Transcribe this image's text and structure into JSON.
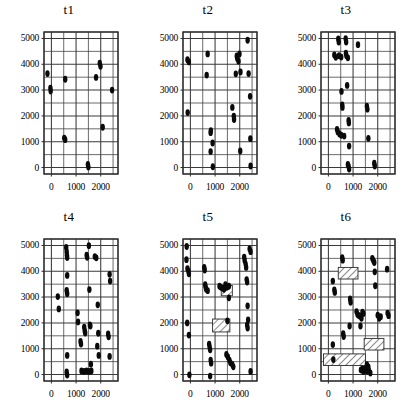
{
  "figure": {
    "kind": "scatter-panel-grid",
    "rows": 2,
    "cols": 3,
    "marker_color": "#0a0a0a",
    "grid_color": "#3a3a3a",
    "frame_color": "#2b2b2b"
  },
  "axes": {
    "y_ticks": [
      0,
      1000,
      2000,
      3000,
      4000,
      5000
    ],
    "y_tick_labels": [
      "0",
      "1000",
      "2000",
      "3000",
      "4000",
      "5000"
    ],
    "x_ticks": [
      0,
      1000,
      2000
    ],
    "x_tick_labels": [
      "0",
      "1000",
      "2000"
    ],
    "xlim": [
      -300,
      2700
    ],
    "ylim": [
      -250,
      5250
    ],
    "x_gridstep": 500,
    "y_gridstep": 500,
    "xlabel": "",
    "ylabel": "",
    "grid": true,
    "legend": "none"
  },
  "chart_data": {
    "type": "scatter",
    "title": "",
    "xlabel": "",
    "ylabel": "",
    "xlim": [
      -300,
      2700
    ],
    "ylim": [
      -250,
      5250
    ],
    "grid": true,
    "panels": [
      {
        "label": "t1",
        "n_points": 11,
        "points": [
          [
            -160,
            3640
          ],
          [
            -40,
            3080
          ],
          [
            -30,
            2960
          ],
          [
            560,
            3420
          ],
          [
            520,
            1140
          ],
          [
            560,
            1080
          ],
          [
            1480,
            120
          ],
          [
            1500,
            20
          ],
          [
            1810,
            3490
          ],
          [
            1960,
            4040
          ],
          [
            1990,
            3920
          ],
          [
            2080,
            1560
          ],
          [
            2460,
            3000
          ]
        ],
        "hatched_rects": []
      },
      {
        "label": "t2",
        "n_points": 24,
        "points": [
          [
            -120,
            4180
          ],
          [
            -60,
            4090
          ],
          [
            -110,
            2130
          ],
          [
            700,
            4400
          ],
          [
            660,
            3580
          ],
          [
            830,
            1430
          ],
          [
            820,
            1350
          ],
          [
            900,
            950
          ],
          [
            820,
            620
          ],
          [
            910,
            30
          ],
          [
            1700,
            2330
          ],
          [
            1760,
            1990
          ],
          [
            1770,
            1860
          ],
          [
            1840,
            3630
          ],
          [
            1880,
            4320
          ],
          [
            1900,
            4220
          ],
          [
            1950,
            4120
          ],
          [
            1990,
            4400
          ],
          [
            2030,
            3700
          ],
          [
            2020,
            640
          ],
          [
            2320,
            4930
          ],
          [
            2360,
            3640
          ],
          [
            2420,
            2760
          ],
          [
            2430,
            1120
          ],
          [
            2440,
            60
          ]
        ],
        "hatched_rects": []
      },
      {
        "label": "t3",
        "n_points": 30,
        "points": [
          [
            240,
            4360
          ],
          [
            300,
            4270
          ],
          [
            400,
            4980
          ],
          [
            420,
            4860
          ],
          [
            430,
            4330
          ],
          [
            520,
            4280
          ],
          [
            530,
            2950
          ],
          [
            560,
            2430
          ],
          [
            570,
            2330
          ],
          [
            350,
            1480
          ],
          [
            380,
            1380
          ],
          [
            450,
            1300
          ],
          [
            520,
            1250
          ],
          [
            640,
            1220
          ],
          [
            700,
            4990
          ],
          [
            720,
            4860
          ],
          [
            710,
            4430
          ],
          [
            730,
            4330
          ],
          [
            790,
            4250
          ],
          [
            760,
            3180
          ],
          [
            820,
            1830
          ],
          [
            830,
            1730
          ],
          [
            840,
            830
          ],
          [
            790,
            120
          ],
          [
            820,
            40
          ],
          [
            840,
            -60
          ],
          [
            1200,
            4760
          ],
          [
            1560,
            2380
          ],
          [
            1580,
            2260
          ],
          [
            1620,
            1130
          ],
          [
            1860,
            170
          ],
          [
            1880,
            60
          ]
        ],
        "hatched_rects": []
      },
      {
        "label": "t4",
        "n_points": 33,
        "points": [
          [
            260,
            3020
          ],
          [
            300,
            2540
          ],
          [
            600,
            4920
          ],
          [
            620,
            4760
          ],
          [
            630,
            4620
          ],
          [
            640,
            4530
          ],
          [
            640,
            3840
          ],
          [
            620,
            3260
          ],
          [
            640,
            3130
          ],
          [
            640,
            740
          ],
          [
            620,
            100
          ],
          [
            640,
            -20
          ],
          [
            1060,
            2390
          ],
          [
            1080,
            2040
          ],
          [
            1180,
            1280
          ],
          [
            1200,
            1180
          ],
          [
            1330,
            1840
          ],
          [
            1350,
            1700
          ],
          [
            1370,
            1610
          ],
          [
            1430,
            4620
          ],
          [
            1450,
            4540
          ],
          [
            1520,
            4990
          ],
          [
            1540,
            3290
          ],
          [
            1560,
            1920
          ],
          [
            1580,
            1880
          ],
          [
            1600,
            400
          ],
          [
            1220,
            140
          ],
          [
            1320,
            120
          ],
          [
            1420,
            140
          ],
          [
            1520,
            120
          ],
          [
            1620,
            140
          ],
          [
            1760,
            4570
          ],
          [
            1820,
            4520
          ],
          [
            1880,
            2700
          ],
          [
            1900,
            1600
          ],
          [
            1860,
            1100
          ],
          [
            1920,
            740
          ],
          [
            2300,
            1570
          ],
          [
            2320,
            1460
          ],
          [
            2360,
            3880
          ],
          [
            2380,
            3620
          ],
          [
            2360,
            700
          ]
        ],
        "hatched_rects": []
      },
      {
        "label": "t5",
        "n_points": 42,
        "points": [
          [
            -150,
            4960
          ],
          [
            -160,
            4450
          ],
          [
            -120,
            4100
          ],
          [
            -80,
            4000
          ],
          [
            -60,
            3900
          ],
          [
            -130,
            2000
          ],
          [
            -60,
            1530
          ],
          [
            -40,
            -10
          ],
          [
            560,
            4150
          ],
          [
            580,
            4050
          ],
          [
            600,
            3480
          ],
          [
            620,
            3380
          ],
          [
            640,
            3300
          ],
          [
            700,
            3250
          ],
          [
            760,
            1180
          ],
          [
            780,
            1060
          ],
          [
            800,
            960
          ],
          [
            820,
            560
          ],
          [
            840,
            440
          ],
          [
            800,
            -60
          ],
          [
            1180,
            3420
          ],
          [
            1240,
            3380
          ],
          [
            1300,
            3350
          ],
          [
            1360,
            3300
          ],
          [
            1420,
            3480
          ],
          [
            1480,
            3380
          ],
          [
            1560,
            3420
          ],
          [
            1560,
            2970
          ],
          [
            1500,
            2080
          ],
          [
            1460,
            780
          ],
          [
            1520,
            680
          ],
          [
            1580,
            560
          ],
          [
            1620,
            460
          ],
          [
            1700,
            380
          ],
          [
            1740,
            300
          ],
          [
            2180,
            4550
          ],
          [
            2200,
            4420
          ],
          [
            2240,
            4280
          ],
          [
            2260,
            4150
          ],
          [
            2280,
            3680
          ],
          [
            2300,
            3580
          ],
          [
            2320,
            2660
          ],
          [
            2340,
            2120
          ],
          [
            2300,
            1920
          ],
          [
            2320,
            1800
          ],
          [
            2400,
            4870
          ],
          [
            2440,
            4760
          ],
          [
            2440,
            120
          ]
        ],
        "hatched_rects": [
          {
            "x0": 900,
            "x1": 1600,
            "y0": 1650,
            "y1": 2150
          },
          {
            "x0": 1250,
            "x1": 1700,
            "y0": 3050,
            "y1": 3450
          }
        ]
      },
      {
        "label": "t6",
        "n_points": 38,
        "points": [
          [
            180,
            3620
          ],
          [
            240,
            3280
          ],
          [
            260,
            3180
          ],
          [
            180,
            1160
          ],
          [
            200,
            580
          ],
          [
            560,
            4530
          ],
          [
            580,
            4430
          ],
          [
            600,
            1580
          ],
          [
            620,
            1470
          ],
          [
            880,
            2930
          ],
          [
            900,
            2800
          ],
          [
            860,
            1880
          ],
          [
            1140,
            2440
          ],
          [
            1180,
            2330
          ],
          [
            1240,
            2280
          ],
          [
            1280,
            2260
          ],
          [
            1340,
            2180
          ],
          [
            1380,
            2420
          ],
          [
            1420,
            2360
          ],
          [
            1300,
            1880
          ],
          [
            1320,
            180
          ],
          [
            1380,
            220
          ],
          [
            1420,
            120
          ],
          [
            1480,
            180
          ],
          [
            1520,
            240
          ],
          [
            1560,
            140
          ],
          [
            1600,
            220
          ],
          [
            1640,
            160
          ],
          [
            1700,
            60
          ],
          [
            1560,
            380
          ],
          [
            1620,
            300
          ],
          [
            1780,
            4500
          ],
          [
            1820,
            4420
          ],
          [
            1860,
            4340
          ],
          [
            1880,
            3980
          ],
          [
            1900,
            3440
          ],
          [
            2000,
            2300
          ],
          [
            2060,
            2180
          ],
          [
            2120,
            2240
          ],
          [
            2380,
            4080
          ],
          [
            2400,
            2380
          ],
          [
            2440,
            2280
          ]
        ],
        "hatched_rects": [
          {
            "x0": 400,
            "x1": 1200,
            "y0": 3700,
            "y1": 4150
          },
          {
            "x0": 1450,
            "x1": 2250,
            "y0": 950,
            "y1": 1400
          },
          {
            "x0": -200,
            "x1": 1500,
            "y0": 350,
            "y1": 800
          }
        ]
      }
    ]
  }
}
